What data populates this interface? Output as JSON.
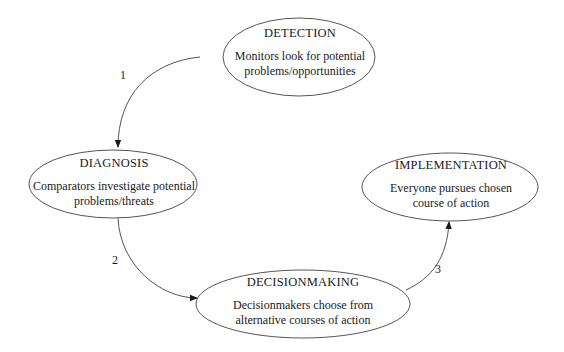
{
  "diagram": {
    "type": "cycle-flow",
    "colors": {
      "stroke": "#555555",
      "text": "#1a1a1a",
      "background": "#ffffff"
    },
    "nodes": [
      {
        "id": "detection",
        "title": "DETECTION",
        "description_line1": "Monitors look for potential",
        "description_line2": "problems/opportunities"
      },
      {
        "id": "diagnosis",
        "title": "DIAGNOSIS",
        "description_line1": "Comparators investigate potential",
        "description_line2": "problems/threats"
      },
      {
        "id": "decisionmaking",
        "title": "DECISIONMAKING",
        "description_line1": "Decisionmakers choose from",
        "description_line2": "alternative courses of action"
      },
      {
        "id": "implementation",
        "title": "IMPLEMENTATION",
        "description_line1": "Everyone pursues chosen",
        "description_line2": "course of action"
      }
    ],
    "edges": [
      {
        "from": "detection",
        "to": "diagnosis",
        "label": "1"
      },
      {
        "from": "diagnosis",
        "to": "decisionmaking",
        "label": "2"
      },
      {
        "from": "decisionmaking",
        "to": "implementation",
        "label": "3"
      }
    ]
  }
}
